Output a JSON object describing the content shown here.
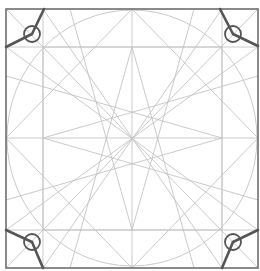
{
  "diagram": {
    "title": "",
    "colors": {
      "guide_line": "#c4c4c4",
      "frame": "#6e6e6e",
      "handle": "#555555",
      "background": "#ffffff"
    },
    "outer_square": {
      "x1": 6,
      "y1": 9,
      "x2": 258,
      "y2": 268
    },
    "inner_square": {
      "x1": 43,
      "y1": 47,
      "x2": 222,
      "y2": 230
    },
    "circle": {
      "cx": 132,
      "cy": 138,
      "rx": 125,
      "ry": 128
    },
    "center": {
      "x": 132,
      "y": 138
    },
    "corner_handles": [
      {
        "name": "top-left",
        "cx": 32,
        "cy": 34
      },
      {
        "name": "top-right",
        "cx": 233,
        "cy": 34
      },
      {
        "name": "bottom-left",
        "cx": 32,
        "cy": 242
      },
      {
        "name": "bottom-right",
        "cx": 233,
        "cy": 242
      }
    ]
  }
}
